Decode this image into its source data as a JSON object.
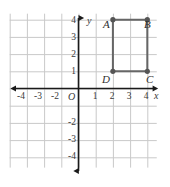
{
  "chart_data": {
    "type": "scatter",
    "title": "",
    "xlabel": "x",
    "ylabel": "y",
    "xlim": [
      -4.6,
      4.6
    ],
    "ylim": [
      -4.6,
      4.6
    ],
    "grid": true,
    "grid_step": 1,
    "legend": "none",
    "origin_label": "O",
    "x_tick_labels": [
      "-4",
      "-3",
      "-2",
      "1",
      "2",
      "3",
      "4"
    ],
    "x_tick_values": [
      -4,
      -3,
      -2,
      1,
      2,
      3,
      4
    ],
    "y_tick_labels": [
      "4",
      "3",
      "2",
      "1",
      "-2",
      "-3",
      "-4"
    ],
    "y_tick_values": [
      4,
      3,
      2,
      1,
      -2,
      -3,
      -4
    ],
    "shapes": [
      {
        "name": "rectangle-abcd",
        "kind": "rectangle",
        "closed": true,
        "color": "#666666",
        "vertices": [
          {
            "label": "A",
            "x": 2,
            "y": 4
          },
          {
            "label": "B",
            "x": 4,
            "y": 4
          },
          {
            "label": "C",
            "x": 4,
            "y": 1
          },
          {
            "label": "D",
            "x": 2,
            "y": 1
          }
        ]
      }
    ],
    "annotations": [
      {
        "text": "A",
        "x": 2,
        "y": 4,
        "position": "above-left"
      },
      {
        "text": "B",
        "x": 4,
        "y": 4,
        "position": "above-right"
      },
      {
        "text": "C",
        "x": 4,
        "y": 1,
        "position": "below-right"
      },
      {
        "text": "D",
        "x": 2,
        "y": 1,
        "position": "below-left"
      }
    ],
    "colors": {
      "grid": "#c9c9c9",
      "axis": "#1a1a1a",
      "shape": "#666666",
      "vertex_dot": "#555555",
      "text": "#3a3a3a"
    }
  },
  "axes": {
    "x_axis_letter": "x",
    "y_axis_letter": "y",
    "origin": "O"
  },
  "ticks": {
    "x": [
      {
        "label": "-4",
        "value": -4
      },
      {
        "label": "-3",
        "value": -3
      },
      {
        "label": "-2",
        "value": -2
      },
      {
        "label": "1",
        "value": 1
      },
      {
        "label": "2",
        "value": 2
      },
      {
        "label": "3",
        "value": 3
      },
      {
        "label": "4",
        "value": 4
      }
    ],
    "y": [
      {
        "label": "4",
        "value": 4
      },
      {
        "label": "3",
        "value": 3
      },
      {
        "label": "2",
        "value": 2
      },
      {
        "label": "1",
        "value": 1
      },
      {
        "label": "-2",
        "value": -2
      },
      {
        "label": "-3",
        "value": -3
      },
      {
        "label": "-4",
        "value": -4
      }
    ]
  },
  "vertices": [
    {
      "label": "A",
      "x": 2,
      "y": 4
    },
    {
      "label": "B",
      "x": 4,
      "y": 4
    },
    {
      "label": "C",
      "x": 4,
      "y": 1
    },
    {
      "label": "D",
      "x": 2,
      "y": 1
    }
  ]
}
